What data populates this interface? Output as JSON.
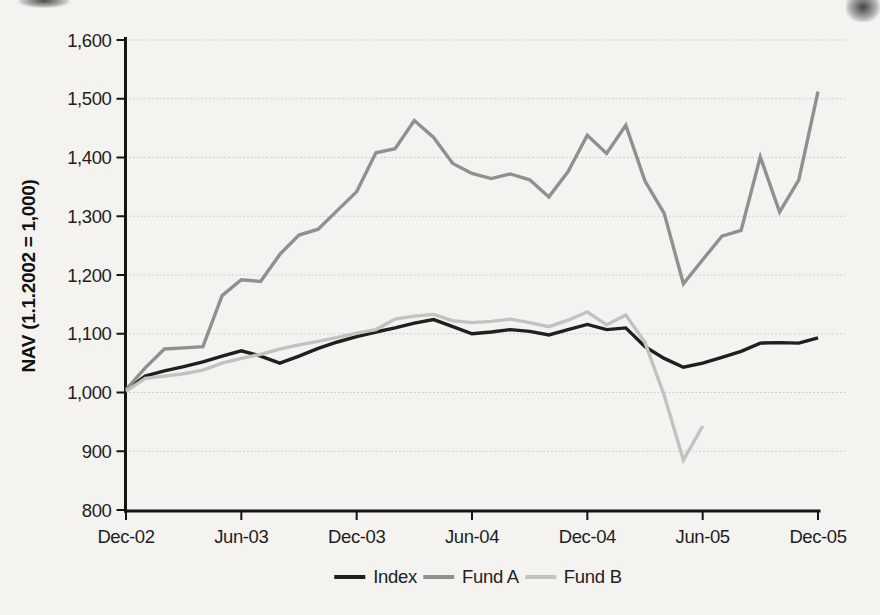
{
  "figure": {
    "background": "#f4f3f0",
    "axis_color": "#141414",
    "gridline_color": "#c9c7c2"
  },
  "chart_data": {
    "type": "line",
    "title": "",
    "xlabel": "",
    "ylabel": "NAV (1.1.2002 = 1,000)",
    "ylim": [
      800,
      1600
    ],
    "grid": "horizontal-dotted",
    "legend_position": "bottom-center",
    "y_ticks": [
      800,
      900,
      1000,
      1100,
      1200,
      1300,
      1400,
      1500,
      1600
    ],
    "y_tick_labels": [
      "800",
      "900",
      "1,000",
      "1,100",
      "1,200",
      "1,300",
      "1,400",
      "1,500",
      "1,600"
    ],
    "x_tick_indices": [
      0,
      6,
      12,
      18,
      24,
      30,
      36
    ],
    "x_tick_labels": [
      "Dec-02",
      "Jun-03",
      "Dec-03",
      "Jun-04",
      "Dec-04",
      "Jun-05",
      "Dec-05"
    ],
    "months": [
      "Dec-02",
      "Jan-03",
      "Feb-03",
      "Mar-03",
      "Apr-03",
      "May-03",
      "Jun-03",
      "Jul-03",
      "Aug-03",
      "Sep-03",
      "Oct-03",
      "Nov-03",
      "Dec-03",
      "Jan-04",
      "Feb-04",
      "Mar-04",
      "Apr-04",
      "May-04",
      "Jun-04",
      "Jul-04",
      "Aug-04",
      "Sep-04",
      "Oct-04",
      "Nov-04",
      "Dec-04",
      "Jan-05",
      "Feb-05",
      "Mar-05",
      "Apr-05",
      "May-05",
      "Jun-05",
      "Jul-05",
      "Aug-05",
      "Sep-05",
      "Oct-05",
      "Nov-05",
      "Dec-05"
    ],
    "series": [
      {
        "name": "Index",
        "color": "#1f1f1f",
        "stroke_width": 3.4,
        "values": [
          1003,
          1028,
          1037,
          1044,
          1052,
          1062,
          1071,
          1062,
          1050,
          1062,
          1075,
          1086,
          1095,
          1103,
          1110,
          1118,
          1124,
          1112,
          1100,
          1103,
          1107,
          1104,
          1098,
          1107,
          1116,
          1107,
          1110,
          1078,
          1058,
          1043,
          1050,
          1060,
          1070,
          1084,
          1085,
          1084,
          1093
        ]
      },
      {
        "name": "Fund A",
        "color": "#909090",
        "stroke_width": 3.4,
        "values": [
          1005,
          1042,
          1074,
          1076,
          1078,
          1165,
          1192,
          1189,
          1235,
          1268,
          1278,
          1310,
          1342,
          1408,
          1415,
          1463,
          1434,
          1390,
          1373,
          1364,
          1372,
          1362,
          1333,
          1376,
          1438,
          1407,
          1455,
          1360,
          1305,
          1185,
          1226,
          1266,
          1276,
          1401,
          1307,
          1362,
          1512
        ]
      },
      {
        "name": "Fund B",
        "color": "#c2c2c2",
        "stroke_width": 3.4,
        "values": [
          1002,
          1024,
          1028,
          1032,
          1038,
          1050,
          1058,
          1065,
          1074,
          1081,
          1087,
          1094,
          1101,
          1107,
          1125,
          1130,
          1133,
          1122,
          1119,
          1121,
          1125,
          1119,
          1112,
          1123,
          1137,
          1115,
          1132,
          1085,
          995,
          885,
          943,
          null,
          null,
          null,
          null,
          null,
          null
        ]
      }
    ]
  }
}
